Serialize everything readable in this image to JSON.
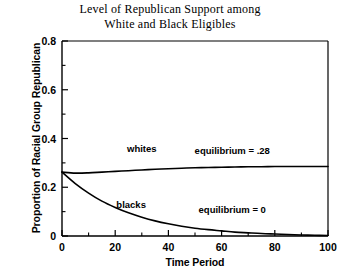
{
  "chart_data": {
    "type": "line",
    "title": "Level of Republican Support among White and Black Eligibles",
    "title_line1": "Level of Republican Support among",
    "title_line2": "White and Black Eligibles",
    "xlabel": "Time Period",
    "ylabel": "Proportion of Racial Group Republican",
    "xlim": [
      0,
      100
    ],
    "ylim": [
      0,
      0.8
    ],
    "xticks": [
      0,
      20,
      40,
      60,
      80,
      100
    ],
    "xtick_labels": [
      "0",
      "20",
      "40",
      "60",
      "80",
      "100"
    ],
    "xminor_ticks": [
      10,
      30,
      50,
      70,
      90
    ],
    "yticks": [
      0,
      0.2,
      0.4,
      0.6,
      0.8
    ],
    "ytick_labels": [
      "0",
      "0.2",
      "0.4",
      "0.6",
      "0.8"
    ],
    "yminor_ticks": [
      0.1,
      0.3,
      0.5,
      0.7
    ],
    "grid": false,
    "legend": "inline-labels",
    "line_color": "#000000",
    "series": [
      {
        "name": "whites",
        "label": "whites",
        "label_x": 30,
        "label_y": 0.345,
        "x": [
          0,
          5,
          10,
          15,
          20,
          25,
          30,
          35,
          40,
          45,
          50,
          55,
          60,
          65,
          70,
          75,
          80,
          85,
          90,
          95,
          100
        ],
        "values": [
          0.262,
          0.258,
          0.259,
          0.262,
          0.265,
          0.268,
          0.271,
          0.274,
          0.276,
          0.278,
          0.28,
          0.281,
          0.282,
          0.283,
          0.284,
          0.284,
          0.285,
          0.285,
          0.285,
          0.285,
          0.285
        ]
      },
      {
        "name": "blacks",
        "label": "blacks",
        "label_x": 26,
        "label_y": 0.115,
        "x": [
          0,
          5,
          10,
          15,
          20,
          25,
          30,
          35,
          40,
          45,
          50,
          55,
          60,
          65,
          70,
          75,
          80,
          85,
          90,
          95,
          100
        ],
        "values": [
          0.262,
          0.215,
          0.176,
          0.143,
          0.117,
          0.095,
          0.077,
          0.062,
          0.05,
          0.04,
          0.032,
          0.026,
          0.021,
          0.016,
          0.013,
          0.01,
          0.008,
          0.006,
          0.004,
          0.003,
          0.002
        ]
      }
    ],
    "annotations": [
      {
        "name": "equilibrium-whites",
        "text": "equilibrium = .28",
        "x": 64,
        "y": 0.335
      },
      {
        "name": "equilibrium-blacks",
        "text": "equilibrium = 0",
        "x": 64,
        "y": 0.093
      }
    ]
  }
}
